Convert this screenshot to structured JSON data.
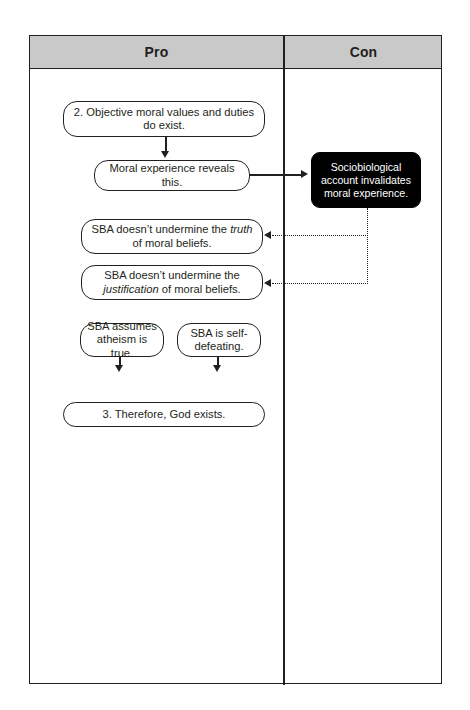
{
  "diagram": {
    "type": "pro-con argument flowchart",
    "columns": [
      {
        "id": "pro",
        "label": "Pro"
      },
      {
        "id": "con",
        "label": "Con"
      }
    ],
    "nodes": {
      "objective": {
        "column": "pro",
        "style": "rounded-outline",
        "text": "2. Objective moral values and duties do exist."
      },
      "moral_experience": {
        "column": "pro",
        "style": "rounded-outline",
        "text": "Moral experience reveals this."
      },
      "truth": {
        "column": "pro",
        "style": "rounded-outline",
        "text_before_italic": "SBA doesn’t undermine the ",
        "italic": "truth",
        "text_after_italic": " of moral beliefs."
      },
      "justification": {
        "column": "pro",
        "style": "rounded-outline",
        "text_before_italic": "SBA doesn’t undermine the ",
        "italic": "justification",
        "text_after_italic": " of moral beliefs."
      },
      "atheism": {
        "column": "pro",
        "style": "rounded-outline",
        "text": "SBA assumes atheism is true."
      },
      "self_defeating": {
        "column": "pro",
        "style": "rounded-outline",
        "text": "SBA is self-defeating."
      },
      "therefore": {
        "column": "pro",
        "style": "rounded-outline",
        "text": "3. Therefore, God exists."
      },
      "sociobiological": {
        "column": "con",
        "style": "filled-black",
        "text": "Sociobiological account invalidates moral experience."
      }
    },
    "edges": [
      {
        "from": "objective",
        "to": "moral_experience",
        "line": "solid",
        "direction": "down"
      },
      {
        "from": "moral_experience",
        "to": "sociobiological",
        "line": "solid",
        "direction": "right"
      },
      {
        "from": "sociobiological",
        "to": "truth",
        "line": "dotted",
        "direction": "left"
      },
      {
        "from": "sociobiological",
        "to": "justification",
        "line": "dotted",
        "direction": "left"
      },
      {
        "from": "justification",
        "to": "atheism",
        "line": "solid",
        "direction": "down"
      },
      {
        "from": "justification",
        "to": "self_defeating",
        "line": "solid",
        "direction": "down"
      }
    ]
  },
  "colors": {
    "ink": "#231f20",
    "header_fill": "#c9c9c9",
    "node_fill": "#ffffff",
    "black_node_fill": "#000000",
    "black_node_text": "#ffffff",
    "page_background": "#ffffff"
  }
}
